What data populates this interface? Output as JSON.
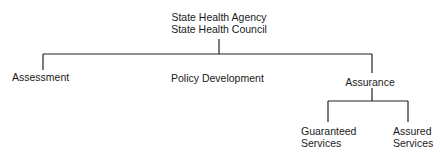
{
  "diagram": {
    "type": "org-chart",
    "root": {
      "lines": [
        "State Health Agency",
        "State Health Council"
      ]
    },
    "level1": [
      {
        "label": "Assessment"
      },
      {
        "label": "Policy Development"
      },
      {
        "label": "Assurance"
      }
    ],
    "level2": [
      {
        "lines": [
          "Guaranteed",
          "Services"
        ]
      },
      {
        "lines": [
          "Assured",
          "Services"
        ]
      }
    ],
    "edges": [
      [
        "State Health Agency / State Health Council",
        "Assessment"
      ],
      [
        "State Health Agency / State Health Council",
        "Policy Development"
      ],
      [
        "State Health Agency / State Health Council",
        "Assurance"
      ],
      [
        "Assurance",
        "Guaranteed Services"
      ],
      [
        "Assurance",
        "Assured Services"
      ]
    ],
    "line_color": "#222222"
  }
}
